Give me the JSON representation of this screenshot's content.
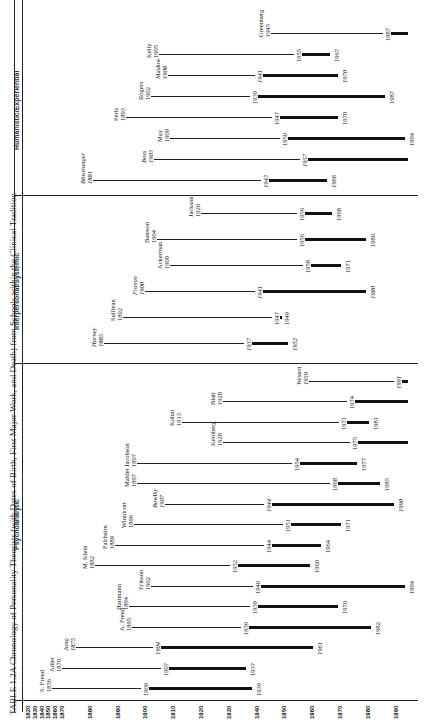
{
  "title": "TABLE 1.2A Chronology of Personality Theorists (with Dates of Birth, First Major Work, and Death) from Schools within the Clinical Tradition",
  "chart_data": {
    "type": "timeline",
    "title": "Chronology of Personality Theorists (with Dates of Birth, First Major Work, and Death) from Schools within the Clinical Tradition",
    "xlabel": "Year",
    "x_ticks": [
      1820,
      1830,
      1840,
      1850,
      1860,
      1870,
      1880,
      1890,
      1900,
      1910,
      1920,
      1930,
      1940,
      1950,
      1960,
      1970,
      1980,
      1990
    ],
    "legend": {
      "thin_line": "birth to first major work",
      "thick_line": "first major work to death"
    },
    "sections": [
      {
        "name": "Psychoanalytic",
        "theorists": [
          {
            "name": "S. Freud",
            "birth": 1856,
            "major_work": 1900,
            "death": 1939
          },
          {
            "name": "Adler",
            "birth": 1870,
            "major_work": 1907,
            "death": 1937
          },
          {
            "name": "Jung",
            "birth": 1875,
            "major_work": 1904,
            "death": 1961,
            "italic": true
          },
          {
            "name": "A. Freud",
            "birth": 1895,
            "major_work": 1936,
            "death": 1982
          },
          {
            "name": "Hartmann",
            "birth": 1894,
            "major_work": 1939,
            "death": 1970
          },
          {
            "name": "Erikson",
            "birth": 1902,
            "major_work": 1940,
            "death": 1994
          },
          {
            "name": "M. Klein",
            "birth": 1882,
            "major_work": 1932,
            "death": 1960
          },
          {
            "name": "Fairbairn",
            "birth": 1889,
            "major_work": 1944,
            "death": 1964
          },
          {
            "name": "Winnicott",
            "birth": 1896,
            "major_work": 1951,
            "death": 1971
          },
          {
            "name": "Bowlby",
            "birth": 1907,
            "major_work": 1944,
            "death": 1990,
            "italic": true
          },
          {
            "name": "Mahler",
            "birth": 1897,
            "major_work": 1968,
            "death": 1985
          },
          {
            "name": "Jacobson",
            "birth": 1897,
            "major_work": 1954,
            "death": 1977
          },
          {
            "name": "Kernberg",
            "birth": 1928,
            "major_work": 1975,
            "death": null
          },
          {
            "name": "Kohut",
            "birth": 1913,
            "major_work": 1971,
            "death": 1981
          },
          {
            "name": "Blatt",
            "birth": 1928,
            "major_work": 1974,
            "death": null
          },
          {
            "name": "Westen",
            "birth": 1959,
            "major_work": 1991,
            "death": null,
            "italic": true
          }
        ]
      },
      {
        "name": "Interpersonal/Systemic",
        "theorists": [
          {
            "name": "Horney",
            "birth": 1885,
            "major_work": 1937,
            "death": 1952,
            "italic": true
          },
          {
            "name": "Sullivan",
            "birth": 1892,
            "major_work": 1947,
            "death": 1949
          },
          {
            "name": "Fromm",
            "birth": 1900,
            "major_work": 1941,
            "death": 1980,
            "italic": true
          },
          {
            "name": "Ackerman",
            "birth": 1909,
            "major_work": 1958,
            "death": 1971
          },
          {
            "name": "Bateson",
            "birth": 1904,
            "major_work": 1956,
            "death": 1980
          },
          {
            "name": "Jackson",
            "birth": 1920,
            "major_work": 1956,
            "death": 1968
          }
        ]
      },
      {
        "name": "Humanistic/Experiential",
        "theorists": [
          {
            "name": "Binswanger",
            "birth": 1881,
            "major_work": 1943,
            "death": 1966,
            "italic": true
          },
          {
            "name": "Boss",
            "birth": 1903,
            "major_work": 1957,
            "death": null,
            "italic": true
          },
          {
            "name": "May",
            "birth": 1909,
            "major_work": 1950,
            "death": 1994
          },
          {
            "name": "Perls",
            "birth": 1893,
            "major_work": 1947,
            "death": 1970
          },
          {
            "name": "Rogers",
            "birth": 1902,
            "major_work": 1939,
            "death": 1987
          },
          {
            "name": "Maslow",
            "birth": 1908,
            "major_work": 1941,
            "death": 1970,
            "italic": true
          },
          {
            "name": "Kelly",
            "birth": 1905,
            "major_work": 1955,
            "death": 1967
          },
          {
            "name": "Greenberg",
            "birth": 1945,
            "major_work": 1987,
            "death": null
          }
        ]
      }
    ]
  }
}
